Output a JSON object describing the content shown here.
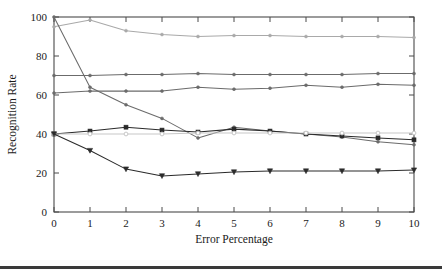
{
  "chart_data": {
    "type": "line",
    "title": "",
    "xlabel": "Error Percentage",
    "ylabel": "Recognition Rate",
    "xlim": [
      0,
      10
    ],
    "ylim": [
      0,
      100
    ],
    "xticks": [
      0,
      1,
      2,
      3,
      4,
      5,
      6,
      7,
      8,
      9,
      10
    ],
    "xtick_labels": [
      "0",
      "1",
      "2",
      "3",
      "4",
      "5",
      "6",
      "7",
      "8",
      "9",
      "10"
    ],
    "yticks": [
      0,
      20,
      40,
      60,
      80,
      100
    ],
    "ytick_labels": [
      "0",
      "20",
      "40",
      "60",
      "80",
      "100"
    ],
    "grid": false,
    "legend": "none",
    "x": [
      0,
      1,
      2,
      3,
      4,
      5,
      6,
      7,
      8,
      9,
      10
    ],
    "series": [
      {
        "name": "series-1-light-top",
        "color": "#a9a9a9",
        "marker": "dot",
        "values": [
          95,
          98.5,
          93,
          91,
          90,
          90.5,
          90.5,
          90,
          90,
          90,
          89.5
        ]
      },
      {
        "name": "series-2-flat-70",
        "color": "#6b6b6b",
        "marker": "dot",
        "values": [
          70,
          70,
          70.5,
          70.5,
          71,
          70.5,
          70.5,
          70.5,
          70.5,
          71,
          71
        ]
      },
      {
        "name": "series-3-rising-62",
        "color": "#6b6b6b",
        "marker": "dot",
        "values": [
          61,
          62,
          62,
          62,
          64,
          63,
          63.5,
          65,
          64,
          65.5,
          65
        ]
      },
      {
        "name": "series-4-steep-decline",
        "color": "#6b6b6b",
        "marker": "dot",
        "values": [
          100,
          64,
          55,
          48,
          38,
          43.5,
          41.5,
          40,
          38.5,
          36,
          34.5
        ]
      },
      {
        "name": "series-5-bump-41",
        "color": "#2b2b2b",
        "marker": "square",
        "values": [
          40,
          41.5,
          43.5,
          42,
          41,
          42.5,
          41.5,
          40,
          39,
          38,
          37
        ]
      },
      {
        "name": "series-6-flat-40-light",
        "color": "#c8c8c8",
        "marker": "circle",
        "values": [
          40,
          40,
          40,
          40,
          40.5,
          40.5,
          40.5,
          40.5,
          40.5,
          40.5,
          40.5
        ]
      },
      {
        "name": "series-7-bottom-dip",
        "color": "#2b2b2b",
        "marker": "triangle-down",
        "values": [
          40,
          31.5,
          22,
          18.5,
          19.5,
          20.5,
          21,
          21,
          21,
          21,
          21.5
        ]
      }
    ]
  }
}
